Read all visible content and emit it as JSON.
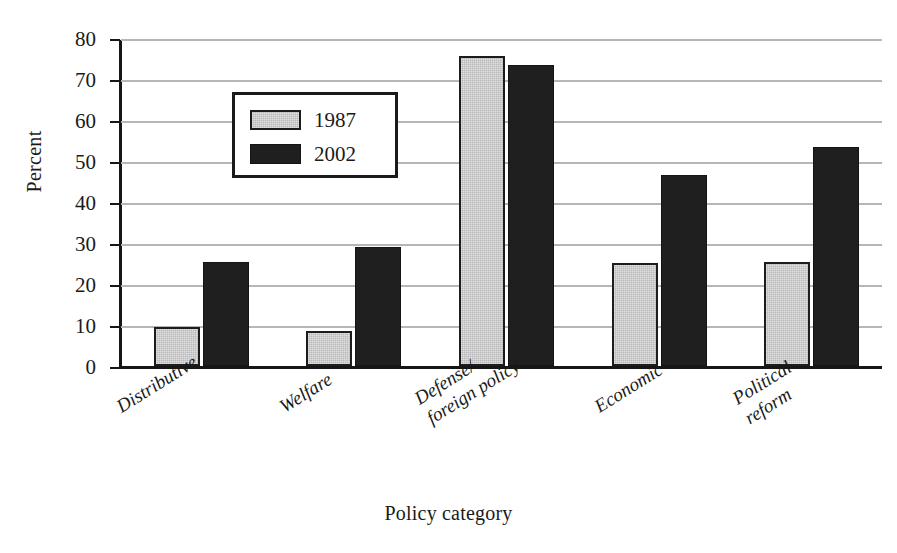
{
  "chart_data": {
    "type": "bar",
    "title": "",
    "xlabel": "Policy category",
    "ylabel": "Percent",
    "categories": [
      "Distributive",
      "Welfare",
      "Defense/ foreign policy",
      "Economic",
      "Political reform"
    ],
    "category_lines": [
      [
        "Distributive"
      ],
      [
        "Welfare"
      ],
      [
        "Defense/",
        "foreign policy"
      ],
      [
        "Economic"
      ],
      [
        "Political",
        "reform"
      ]
    ],
    "series": [
      {
        "name": "1987",
        "color": "#b9b9b9",
        "values": [
          9.5,
          8.5,
          75.5,
          25.2,
          25.3
        ]
      },
      {
        "name": "2002",
        "color": "#1f1f1f",
        "values": [
          25.3,
          29.0,
          73.5,
          46.5,
          53.5
        ]
      }
    ],
    "ylim": [
      0,
      80
    ],
    "yticks": [
      0,
      10,
      20,
      30,
      40,
      50,
      60,
      70,
      80
    ],
    "ytick_labels": [
      "0",
      "10",
      "20",
      "30",
      "40",
      "50",
      "60",
      "70",
      "80"
    ],
    "grid": true,
    "legend_position": "upper-center-left",
    "xtick_rotation": -32
  },
  "axis": {
    "y_title": "Percent",
    "x_title": "Policy category"
  },
  "legend": {
    "entries": [
      {
        "label": "1987"
      },
      {
        "label": "2002"
      }
    ]
  }
}
